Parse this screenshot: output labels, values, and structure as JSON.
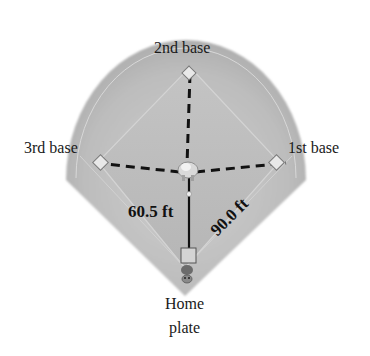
{
  "diagram": {
    "type": "baseball-diamond",
    "labels": {
      "second_base": "2nd base",
      "third_base": "3rd base",
      "first_base": "1st base",
      "home_line1": "Home",
      "home_line2": "plate"
    },
    "measurements": {
      "pitcher_to_home": "60.5 ft",
      "base_to_base": "90.0 ft"
    },
    "colors": {
      "field_outer": "#b9b9b9",
      "field_inner": "#c6c6c6",
      "infield": "#bdbdbd",
      "lines": "#111111",
      "base_fill": "#e6e6e6",
      "text": "#1a1a1a"
    }
  }
}
